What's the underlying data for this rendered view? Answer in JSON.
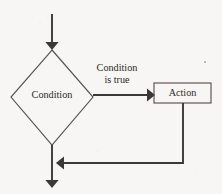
{
  "diagram": {
    "type": "flowchart",
    "background_color": "#f7f6f4",
    "ink_color": "#3a3936",
    "nodes": {
      "condition": {
        "shape": "diamond",
        "label": "Condition"
      },
      "action": {
        "shape": "rectangle",
        "label": "Action"
      }
    },
    "edges": {
      "entry": {
        "label": "",
        "arrow": "down"
      },
      "branch_true": {
        "label_line1": "Condition",
        "label_line2": "is true",
        "arrow": "right"
      },
      "loop_back": {
        "label": "",
        "arrow": "left"
      },
      "exit": {
        "label": "",
        "arrow": "down"
      }
    }
  },
  "artifacts": {
    "speck_label": "scan-speck"
  }
}
